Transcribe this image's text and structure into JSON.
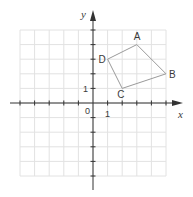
{
  "axes": {
    "x_label": "x",
    "y_label": "y",
    "origin_label": "0",
    "x_unit_label": "1",
    "y_unit_label": "1",
    "x_range": [
      -5,
      5
    ],
    "y_range": [
      -5,
      5
    ]
  },
  "colors": {
    "grid": "#e2e2e2",
    "axis": "#333333",
    "polygon": "#9a9a9a",
    "text": "#3a3a3a"
  },
  "points": [
    {
      "name": "A",
      "x": 3,
      "y": 4
    },
    {
      "name": "B",
      "x": 5,
      "y": 2
    },
    {
      "name": "C",
      "x": 2,
      "y": 1
    },
    {
      "name": "D",
      "x": 1,
      "y": 3
    }
  ],
  "polygon_order": [
    "A",
    "B",
    "C",
    "D"
  ]
}
